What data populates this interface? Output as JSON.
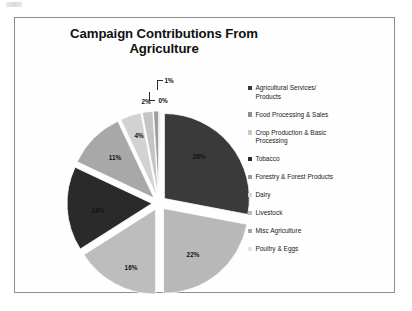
{
  "slide": {
    "title": "Campaign Contributions From Agriculture"
  },
  "chart_data": {
    "type": "pie",
    "title": "Campaign Contributions From Agriculture",
    "xlabel": "",
    "ylabel": "",
    "legend_position": "right",
    "exploded": true,
    "units": "percent",
    "categories": [
      "Agricultural Services/ Products",
      "Food Processing & Sales",
      "Crop Production & Basic Processing",
      "Tobacco",
      "Forestry & Forest Products",
      "Dairy",
      "Livestock",
      "Misc Agriculture",
      "Poultry & Eggs"
    ],
    "values": [
      28,
      22,
      16,
      16,
      11,
      4,
      2,
      1,
      0
    ],
    "labels": [
      "28%",
      "22%",
      "16%",
      "16%",
      "11%",
      "4%",
      "2%",
      "1%",
      "0%"
    ],
    "colors": [
      "#3a3a3a",
      "#b8b8b8",
      "#bdbdbd",
      "#2a2a2a",
      "#a8a8a8",
      "#d2d2d2",
      "#c4c4c4",
      "#9e9e9e",
      "#e2e2e2"
    ],
    "slices": [
      {
        "label": "Agricultural Services/ Products",
        "value": 28,
        "display": "28%",
        "color": "#3a3a3a"
      },
      {
        "label": "Food Processing & Sales",
        "value": 22,
        "display": "22%",
        "color": "#b8b8b8"
      },
      {
        "label": "Crop Production & Basic Processing",
        "value": 16,
        "display": "16%",
        "color": "#bdbdbd"
      },
      {
        "label": "Tobacco",
        "value": 16,
        "display": "16%",
        "color": "#2a2a2a"
      },
      {
        "label": "Forestry & Forest Products",
        "value": 11,
        "display": "11%",
        "color": "#a8a8a8"
      },
      {
        "label": "Dairy",
        "value": 4,
        "display": "4%",
        "color": "#d2d2d2"
      },
      {
        "label": "Livestock",
        "value": 2,
        "display": "2%",
        "color": "#c4c4c4"
      },
      {
        "label": "Misc Agriculture",
        "value": 1,
        "display": "1%",
        "color": "#9e9e9e"
      },
      {
        "label": "Poultry & Eggs",
        "value": 0,
        "display": "0%",
        "color": "#e2e2e2"
      }
    ]
  },
  "legend": {
    "items": [
      {
        "label": "Agricultural Services/\nProducts",
        "color": "#3a3a3a"
      },
      {
        "label": "Food Processing & Sales",
        "color": "#8f8f8f"
      },
      {
        "label": "Crop Production & Basic\nProcessing",
        "color": "#c9c9c9"
      },
      {
        "label": "Tobacco",
        "color": "#2a2a2a"
      },
      {
        "label": "Forestry & Forest Products",
        "color": "#9c9c9c"
      },
      {
        "label": "Dairy",
        "color": "#d8d8d8"
      },
      {
        "label": "Livestock",
        "color": "#bdbdbd"
      },
      {
        "label": "Misc Agriculture",
        "color": "#a5a5a5"
      },
      {
        "label": "Poultry & Eggs",
        "color": "#e4e4e4"
      }
    ]
  }
}
